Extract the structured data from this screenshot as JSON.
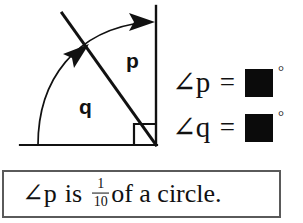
{
  "diagram": {
    "name": "angle-diagram",
    "labels": {
      "p": "p",
      "q": "q"
    },
    "colors": {
      "stroke": "#111111",
      "background": "#ffffff"
    },
    "right_angle_marker": "square"
  },
  "equations": [
    {
      "angle_symbol": "∠",
      "variable": "p",
      "label": "∠p",
      "equals": "=",
      "answer_value": "",
      "unit": "°",
      "answer_fill": "#0b0b0b"
    },
    {
      "angle_symbol": "∠",
      "variable": "q",
      "label": "∠q",
      "equals": "=",
      "answer_value": "",
      "unit": "°",
      "answer_fill": "#0b0b0b"
    }
  ],
  "statement": {
    "prefix": "∠p",
    "verb": "is",
    "fraction": {
      "numerator": "1",
      "denominator": "10"
    },
    "suffix": "of a circle.",
    "full_text": "∠p is 1/10 of a circle.",
    "border_color": "#5a5a5a"
  }
}
